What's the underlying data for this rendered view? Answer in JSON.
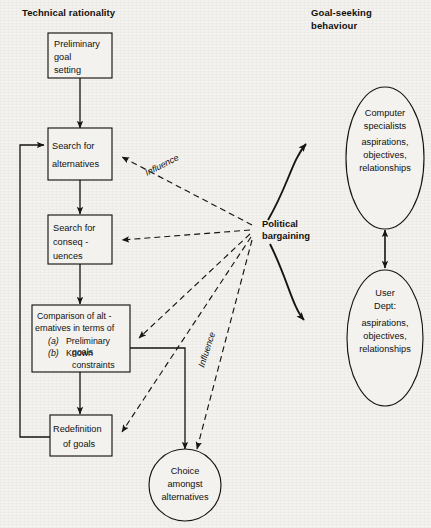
{
  "figure": {
    "headings": {
      "left": "Technical rationality",
      "right_line1": "Goal-seeking",
      "right_line2": "behaviour"
    },
    "nodes": {
      "preliminary_goal_setting": {
        "shape": "rect",
        "lines": [
          "Preliminary",
          "goal",
          "setting"
        ]
      },
      "search_for_alternatives": {
        "shape": "rect",
        "lines": [
          "Search for",
          "alternatives"
        ]
      },
      "search_for_consequences": {
        "shape": "rect",
        "lines": [
          "Search for",
          "conseq -",
          "uences"
        ]
      },
      "comparison_of_alternatives": {
        "shape": "rect",
        "lines": [
          "Comparison of alt -",
          "ernatives  in terms of"
        ],
        "items": [
          {
            "marker": "(a)",
            "text_line1": "Preliminary",
            "text_line2": "goals"
          },
          {
            "marker": "(b)",
            "text_line1": "Known",
            "text_line2": "constraints"
          }
        ]
      },
      "redefinition_of_goals": {
        "shape": "rect",
        "lines": [
          "Redefinition",
          "of goals"
        ]
      },
      "choice_amongst_alternatives": {
        "shape": "circle",
        "lines": [
          "Choice",
          "amongst",
          "alternatives"
        ]
      },
      "political_bargaining": {
        "shape": "hub",
        "lines": [
          "Political",
          "bargaining"
        ]
      },
      "computer_specialists": {
        "shape": "ellipse",
        "title_line1": "Computer",
        "title_line2": "specialists",
        "lines": [
          "aspirations,",
          "objectives,",
          "relationships"
        ]
      },
      "user_dept": {
        "shape": "ellipse",
        "title_line1": "User",
        "title_line2": "Dept:",
        "lines": [
          "aspirations,",
          "objectives,",
          "relationships"
        ]
      }
    },
    "edge_labels": {
      "influence_upper": "Influence",
      "influence_lower": "Influence"
    },
    "colors": {
      "ink": "#17150f",
      "paper": "#f3f2ef"
    }
  }
}
